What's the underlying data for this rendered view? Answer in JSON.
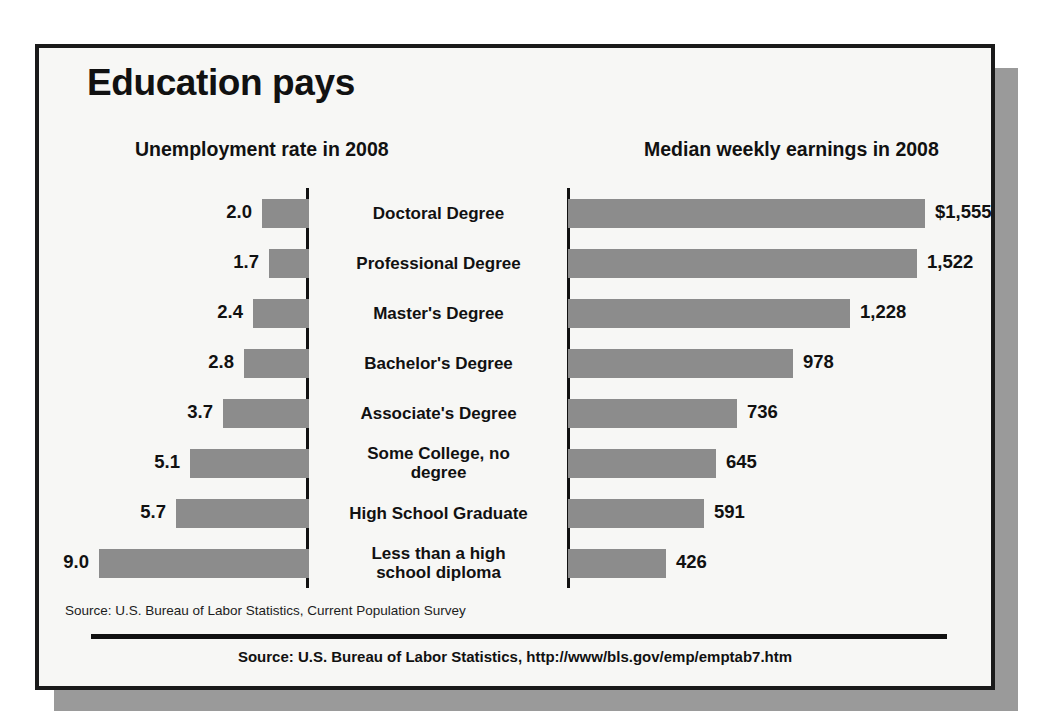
{
  "poster": {
    "main_title": "Education pays",
    "left_panel_title": "Unemployment rate in 2008",
    "right_panel_title": "Median weekly earnings in 2008",
    "source_note": "Source: U.S. Bureau of Labor Statistics, Current Population Survey",
    "source_footer": "Source: U.S. Bureau of Labor Statistics, http://www/bls.gov/emp/emptab7.htm",
    "bar_color": "#8c8c8c",
    "frame_color": "#1a1a1a",
    "background_color": "#f7f7f5",
    "shadow_color": "#9a9a9a"
  },
  "chart_data": {
    "type": "bar",
    "title": "Education pays",
    "orientation": "horizontal",
    "layout": "back-to-back paired bar chart (butterfly / tornado)",
    "categories": [
      "Doctoral Degree",
      "Professional Degree",
      "Master's Degree",
      "Bachelor's Degree",
      "Associate's Degree",
      "Some College, no degree",
      "High School Graduate",
      "Less than a high school diploma"
    ],
    "category_labels_display": [
      [
        "Doctoral Degree"
      ],
      [
        "Professional Degree"
      ],
      [
        "Master's Degree"
      ],
      [
        "Bachelor's Degree"
      ],
      [
        "Associate's Degree"
      ],
      [
        "Some College, no",
        "degree"
      ],
      [
        "High School Graduate"
      ],
      [
        "Less than a high",
        "school diploma"
      ]
    ],
    "series": [
      {
        "name": "Unemployment rate in 2008",
        "unit": "percent",
        "direction": "left",
        "values": [
          2.0,
          1.7,
          2.4,
          2.8,
          3.7,
          5.1,
          5.7,
          9.0
        ],
        "labels": [
          "2.0",
          "1.7",
          "2.4",
          "2.8",
          "3.7",
          "5.1",
          "5.7",
          "9.0"
        ],
        "axis_max": 9.0
      },
      {
        "name": "Median weekly earnings in 2008",
        "unit": "US dollars",
        "direction": "right",
        "values": [
          1555,
          1522,
          1228,
          978,
          736,
          645,
          591,
          426
        ],
        "labels": [
          "$1,555",
          "1,522",
          "1,228",
          "978",
          "736",
          "645",
          "591",
          "426"
        ],
        "axis_max": 1555
      }
    ],
    "xlabel": "",
    "ylabel": "",
    "grid": false,
    "legend": false,
    "annotations": [
      "Source: U.S. Bureau of Labor Statistics, Current Population Survey",
      "Source: U.S. Bureau of Labor Statistics, http://www/bls.gov/emp/emptab7.htm"
    ]
  }
}
